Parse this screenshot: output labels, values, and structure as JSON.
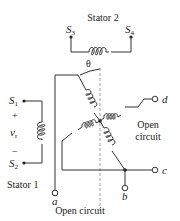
{
  "diagram": {
    "stator2": {
      "label": "Stator 2",
      "terminal_left": "S",
      "terminal_left_sub": "3",
      "terminal_right": "S",
      "terminal_right_sub": "4"
    },
    "angle_label": "θ",
    "stator1": {
      "label": "Stator 1",
      "terminal_top": "S",
      "terminal_top_sub": "1",
      "terminal_bottom": "S",
      "terminal_bottom_sub": "2",
      "plus": "+",
      "minus": "−",
      "voltage": "v",
      "voltage_sub": "r"
    },
    "rotor": {
      "terminal_a": "a",
      "terminal_b": "b",
      "terminal_c": "c",
      "terminal_d": "d"
    },
    "annotations": {
      "open_circuit_right_line1": "Open",
      "open_circuit_right_line2": "circuit",
      "open_circuit_bottom": "Open circuit"
    }
  }
}
